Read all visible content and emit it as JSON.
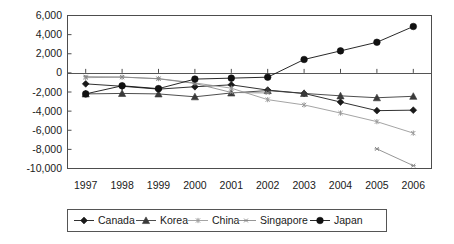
{
  "chart_data": {
    "type": "line",
    "title": "",
    "xlabel": "",
    "ylabel": "",
    "categories": [
      "1997",
      "1998",
      "1999",
      "2000",
      "2001",
      "2002",
      "2003",
      "2004",
      "2005",
      "2006"
    ],
    "ylim": [
      -10000,
      6000
    ],
    "ytick_labels": [
      "6,000",
      "4,000",
      "2,000",
      "0",
      "-2,000",
      "-4,000",
      "-6,000",
      "-8,000",
      "-10,000"
    ],
    "ytick_values": [
      6000,
      4000,
      2000,
      0,
      -2000,
      -4000,
      -6000,
      -8000,
      -10000
    ],
    "grid": false,
    "legend_position": "bottom",
    "series": [
      {
        "name": "Canada",
        "marker": "diamond",
        "color": "#1a1a1a",
        "values": [
          -1150,
          -1400,
          -1700,
          -1450,
          -1250,
          -1800,
          -2150,
          -3050,
          -3950,
          -3900
        ]
      },
      {
        "name": "Korea",
        "marker": "triangle",
        "color": "#3a3a3a",
        "values": [
          -2200,
          -2150,
          -2200,
          -2500,
          -2100,
          -1850,
          -2150,
          -2400,
          -2600,
          -2450
        ]
      },
      {
        "name": "China",
        "marker": "star",
        "color": "#9a9a9a",
        "values": [
          -500,
          -450,
          -600,
          -1050,
          -1600,
          -2800,
          -3350,
          -4200,
          -5100,
          -6300
        ]
      },
      {
        "name": "Singapore",
        "marker": "star-small",
        "color": "#8a8a8a",
        "values": [
          -400,
          -430,
          -620,
          -1100,
          -2050,
          -2100,
          null,
          null,
          -7950,
          -9700
        ]
      },
      {
        "name": "Japan",
        "marker": "circle",
        "color": "#111111",
        "values": [
          -2200,
          -1350,
          -1650,
          -650,
          -550,
          -450,
          1400,
          2300,
          3200,
          4850
        ]
      }
    ]
  },
  "legend": {
    "items": [
      {
        "label": "Canada",
        "marker": "diamond"
      },
      {
        "label": "Korea",
        "marker": "triangle"
      },
      {
        "label": "China",
        "marker": "star"
      },
      {
        "label": "Singapore",
        "marker": "star-small"
      },
      {
        "label": "Japan",
        "marker": "circle"
      }
    ]
  }
}
